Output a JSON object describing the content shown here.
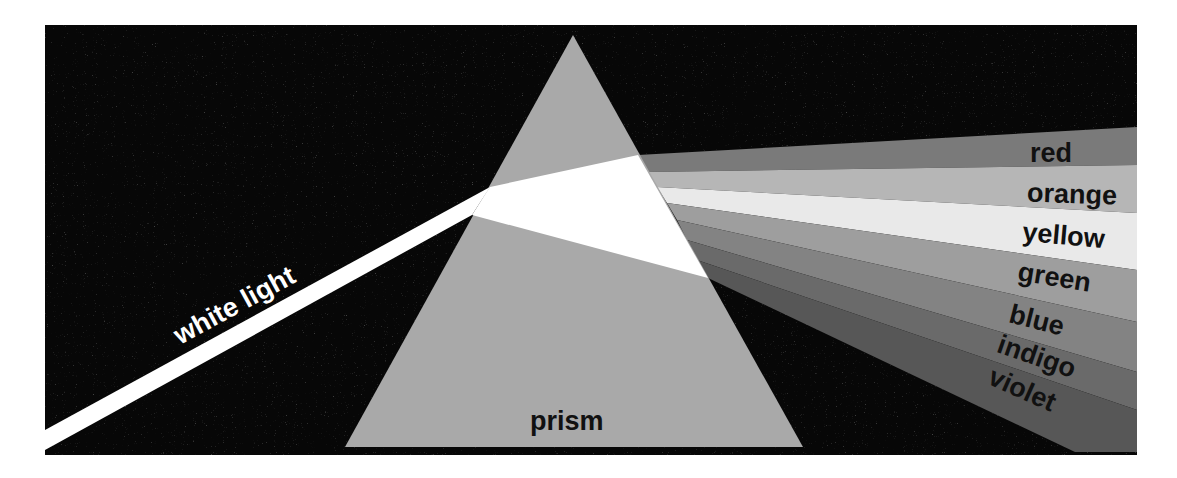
{
  "diagram": {
    "colors": {
      "background": "#ffffff",
      "panel": "#070707",
      "prism": "#a9a9a9",
      "beam": "#ffffff",
      "label_dark": "#111111",
      "label_light": "#ffffff"
    },
    "labels": {
      "incoming": "white light",
      "prism": "prism"
    },
    "spectrum": [
      {
        "name": "red",
        "label": "red",
        "shade": "#7a7a7a"
      },
      {
        "name": "orange",
        "label": "orange",
        "shade": "#b6b6b6"
      },
      {
        "name": "yellow",
        "label": "yellow",
        "shade": "#e9e9e9"
      },
      {
        "name": "green",
        "label": "green",
        "shade": "#9e9e9e"
      },
      {
        "name": "blue",
        "label": "blue",
        "shade": "#838383"
      },
      {
        "name": "indigo",
        "label": "indigo",
        "shade": "#6a6a6a"
      },
      {
        "name": "violet",
        "label": "violet",
        "shade": "#575757"
      }
    ]
  }
}
